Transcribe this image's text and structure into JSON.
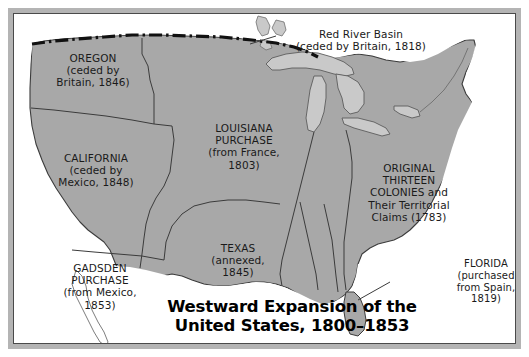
{
  "figure": {
    "kind": "historical-map",
    "title_lines": "Westward Expansion of the\nUnited States, 1800–1853"
  },
  "colors": {
    "land": "#a8a8a8",
    "land_light": "#c9c9c9",
    "water": "#ffffff",
    "outline": "#3b3b3b",
    "frame": "#b4b4b4",
    "frame_inner": "#4a4a4a",
    "text": "#1a1a1a",
    "title": "#000000",
    "callout_bg": "#ffffff"
  },
  "labels": [
    {
      "id": "oregon",
      "name": "label-oregon",
      "text": "OREGON\n(ceded by\nBritain, 1846)",
      "x": 24,
      "y": 38,
      "width": 110
    },
    {
      "id": "california",
      "name": "label-california",
      "text": "CALIFORNIA\n(ceded by\nMexico, 1848)",
      "x": 24,
      "y": 138,
      "width": 116
    },
    {
      "id": "gadsden",
      "name": "label-gadsden-purchase",
      "text": "GADSDEN\nPURCHASE\n(from Mexico,\n1853)",
      "x": 28,
      "y": 248,
      "width": 116
    },
    {
      "id": "louisiana",
      "name": "label-louisiana-purchase",
      "text": "LOUISIANA\nPURCHASE\n(from France,\n1803)",
      "x": 175,
      "y": 108,
      "width": 110
    },
    {
      "id": "texas",
      "name": "label-texas",
      "text": "TEXAS\n(annexed,\n1845)",
      "x": 172,
      "y": 228,
      "width": 104
    },
    {
      "id": "original13",
      "name": "label-original-thirteen-colonies",
      "text": "ORIGINAL\nTHIRTEEN\nCOLONIES and\nTheir Territorial\nClaims (1783)",
      "x": 336,
      "y": 148,
      "width": 118
    }
  ],
  "red_river": {
    "name": "label-red-river-basin",
    "text": "Red River Basin\n(ceded by Britain, 1818)",
    "x": 262,
    "y": 14,
    "width": 170
  },
  "florida": {
    "name": "label-florida-callout",
    "text": "FLORIDA\n(purchased\nfrom Spain,\n1819)",
    "x": 428,
    "y": 240,
    "width": 88
  }
}
